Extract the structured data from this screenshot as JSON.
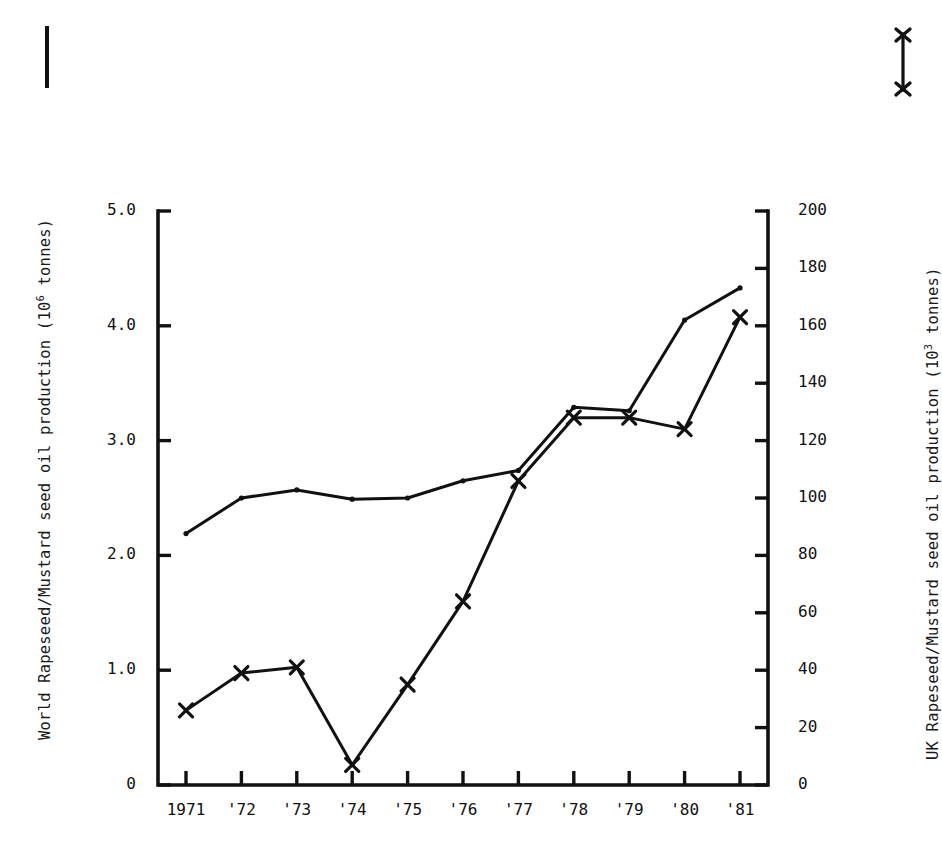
{
  "figure": {
    "background_color": "#ffffff",
    "ink_color": "#111111"
  },
  "axis_titles": {
    "left_prefix": "World Rapeseed/Mustard seed oil production (10",
    "left_exponent": "6",
    "left_suffix": " tonnes)",
    "right_prefix": "UK Rapeseed/Mustard seed oil production (10",
    "right_exponent": "3",
    "right_suffix": " tonnes)"
  },
  "legend": {
    "left_marker_name": "plain-line-key",
    "right_marker_name": "cross-line-key"
  },
  "chart_data": {
    "type": "line",
    "title": "",
    "xlabel": "",
    "ylabel": "World Rapeseed/Mustard seed oil production (10^6 tonnes)",
    "y2label": "UK Rapeseed/Mustard seed oil production (10^3 tonnes)",
    "grid": false,
    "legend_position": "top-corners",
    "categories": [
      "1971",
      "'72",
      "'73",
      "'74",
      "'75",
      "'76",
      "'77",
      "'78",
      "'79",
      "'80",
      "'81"
    ],
    "x_tick_labels": [
      "1971",
      "'72",
      "'73",
      "'74",
      "'75",
      "'76",
      "'77",
      "'78",
      "'79",
      "'80",
      "'81"
    ],
    "ylim": [
      0,
      5.0
    ],
    "y_tick_labels": [
      "5.0",
      "4.0",
      "3.0",
      "2.0",
      "1.0",
      "0"
    ],
    "y_tick_values": [
      5.0,
      4.0,
      3.0,
      2.0,
      1.0,
      0
    ],
    "y2lim": [
      0,
      200
    ],
    "y2_tick_labels": [
      "200",
      "180",
      "160",
      "140",
      "120",
      "100",
      "80",
      "60",
      "40",
      "20",
      "0"
    ],
    "y2_tick_values": [
      200,
      180,
      160,
      140,
      120,
      100,
      80,
      60,
      40,
      20,
      0
    ],
    "series": [
      {
        "name": "World Rapeseed/Mustard seed oil production",
        "axis": "left",
        "units": "10^6 tonnes",
        "marker": "dot",
        "values": [
          2.19,
          2.5,
          2.57,
          2.49,
          2.5,
          2.65,
          2.74,
          3.29,
          3.26,
          4.05,
          4.33
        ]
      },
      {
        "name": "UK Rapeseed/Mustard seed oil production",
        "axis": "right",
        "units": "10^3 tonnes",
        "marker": "cross",
        "values": [
          26,
          39,
          41,
          7,
          35,
          64,
          106,
          128,
          128,
          124,
          163
        ]
      }
    ]
  }
}
